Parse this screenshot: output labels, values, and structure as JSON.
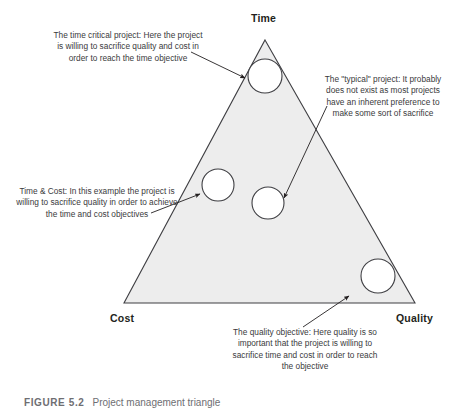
{
  "figure": {
    "caption_number": "FIGURE 5.2",
    "caption_text": "Project management triangle"
  },
  "triangle": {
    "fill_color": "#ededed",
    "stroke_color": "#3f3f43",
    "vertices": {
      "time": "Time",
      "cost": "Cost",
      "quality": "Quality"
    }
  },
  "circle_color": "#ffffff",
  "circle_stroke": "#3f3f43",
  "callouts": [
    {
      "id": "time-critical",
      "text": "The time critical project: Here the project is willing to sacrifice quality and cost in order to reach the time objective"
    },
    {
      "id": "typical",
      "text": "The \"typical\" project: It probably does not exist as most projects have an inherent preference to make some sort of sacrifice"
    },
    {
      "id": "time-cost",
      "text": "Time & Cost: In this example the project is willing to sacrifice quality in order to achieve the time and cost objectives"
    },
    {
      "id": "quality",
      "text": "The quality objective: Here quality is so important that the project is willing to sacrifice time and cost in order to reach the objective"
    }
  ],
  "markers": [
    {
      "id": "time-critical-marker",
      "cx": 265,
      "cy": 76,
      "r": 17
    },
    {
      "id": "time-cost-marker",
      "cx": 218,
      "cy": 185,
      "r": 16
    },
    {
      "id": "typical-marker",
      "cx": 268,
      "cy": 203,
      "r": 16
    },
    {
      "id": "quality-marker",
      "cx": 378,
      "cy": 276,
      "r": 17
    }
  ]
}
